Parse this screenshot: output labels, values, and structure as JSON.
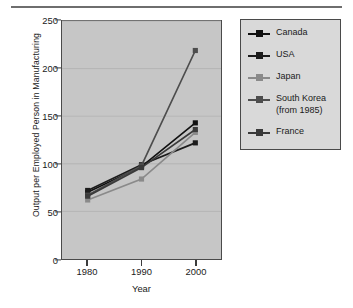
{
  "chart_data": {
    "type": "line",
    "title": "",
    "xlabel": "Year",
    "ylabel": "Output per Employed Person in Manufacturing",
    "categories": [
      "1980",
      "1990",
      "2000"
    ],
    "x": [
      1980,
      1990,
      2000
    ],
    "xlim": [
      1975,
      2005
    ],
    "ylim": [
      0,
      250
    ],
    "yticks": [
      "0",
      "50",
      "100",
      "150",
      "200",
      "250"
    ],
    "ytick_values": [
      0,
      50,
      100,
      150,
      200,
      250
    ],
    "grid": true,
    "grid_axis": "y",
    "legend_position": "right-outside",
    "plot_background": "#c6c6c6",
    "legend_background": "#d9d9d9",
    "series": [
      {
        "name": "Canada",
        "values": [
          70,
          97,
          143
        ],
        "color": "#111111"
      },
      {
        "name": "USA",
        "values": [
          72,
          99,
          122
        ],
        "color": "#1c1c1c"
      },
      {
        "name": "Japan",
        "values": [
          62,
          84,
          133
        ],
        "color": "#8a8a8a"
      },
      {
        "name": "South Korea (from 1985)",
        "values": [
          67,
          98,
          219
        ],
        "color": "#4d4d4d"
      },
      {
        "name": "France",
        "values": [
          66,
          96,
          136
        ],
        "color": "#3a3a3a"
      }
    ]
  },
  "legend": {
    "entries": [
      {
        "label": "Canada"
      },
      {
        "label": "USA"
      },
      {
        "label": "Japan"
      },
      {
        "label": "South Korea\n(from 1985)"
      },
      {
        "label": "France"
      }
    ]
  }
}
